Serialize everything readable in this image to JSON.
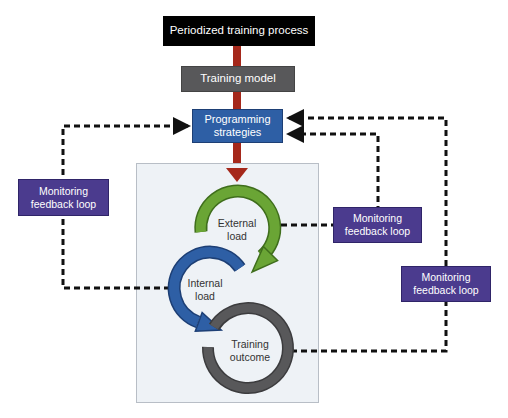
{
  "diagram": {
    "title_box": "Periodized training process",
    "model_box": "Training model",
    "strategies_box": [
      "Programming",
      "strategies"
    ],
    "cycle": {
      "external": [
        "External",
        "load"
      ],
      "internal": [
        "Internal",
        "load"
      ],
      "outcome": [
        "Training",
        "outcome"
      ]
    },
    "feedback_boxes": [
      [
        "Monitoring",
        "feedback loop"
      ],
      [
        "Monitoring",
        "feedback loop"
      ],
      [
        "Monitoring",
        "feedback loop"
      ]
    ],
    "colors": {
      "main_arrow": "#a5281b",
      "external_arc": "#6aa535",
      "internal_arc": "#2e5fa5",
      "outcome_arc": "#58585a",
      "feedback_box": "#4b3b8e",
      "strategies_box": "#2e5fa5",
      "panel": "#eef2f6"
    }
  }
}
